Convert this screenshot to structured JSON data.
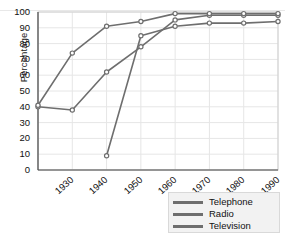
{
  "chart_data": {
    "type": "line",
    "title": "",
    "xlabel": "",
    "ylabel": "Percentage",
    "xlim": [
      1930,
      2000
    ],
    "ylim": [
      0,
      100
    ],
    "grid": true,
    "legend_position": "bottom-right",
    "categories": [
      "1930",
      "1940",
      "1950",
      "1960",
      "1970",
      "1980",
      "1990",
      "2000"
    ],
    "yticks": [
      "0",
      "10",
      "20",
      "30",
      "40",
      "50",
      "60",
      "70",
      "80",
      "90",
      "100"
    ],
    "series": [
      {
        "name": "Telephone",
        "color": "#6e6e6e",
        "x": [
          1930,
          1940,
          1950,
          1960,
          1970,
          1980,
          1990,
          2000
        ],
        "values": [
          40,
          38,
          62,
          78,
          95,
          98,
          98,
          98
        ]
      },
      {
        "name": "Radio",
        "color": "#6e6e6e",
        "x": [
          1930,
          1940,
          1950,
          1960,
          1970,
          1980,
          1990,
          2000
        ],
        "values": [
          41,
          74,
          91,
          94,
          99,
          99,
          99,
          99
        ]
      },
      {
        "name": "Television",
        "color": "#6e6e6e",
        "x": [
          1950,
          1960,
          1970,
          1980,
          1990,
          2000
        ],
        "values": [
          9,
          85,
          91,
          93,
          93,
          94
        ]
      }
    ]
  },
  "legend": {
    "items": [
      {
        "label": "Telephone"
      },
      {
        "label": "Radio"
      },
      {
        "label": "Television"
      }
    ]
  },
  "axes": {
    "y_title": "Percentage"
  }
}
